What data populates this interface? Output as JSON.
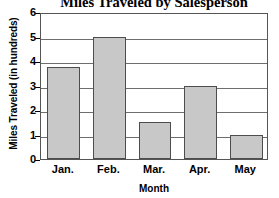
{
  "chart_data": {
    "type": "bar",
    "title": "Miles Traveled by Salesperson",
    "xlabel": "Month",
    "ylabel": "Miles Traveled (in hundreds)",
    "categories": [
      "Jan.",
      "Feb.",
      "Mar.",
      "Apr.",
      "May"
    ],
    "values": [
      3.75,
      5,
      1.5,
      3,
      1
    ],
    "ylim": [
      0,
      6
    ],
    "ytick_labels": [
      "0",
      "1",
      "2",
      "3",
      "4",
      "5",
      "6"
    ],
    "ytick_values": [
      0,
      1,
      2,
      3,
      4,
      5,
      6
    ],
    "grid": true,
    "legend": null,
    "bar_fill_color": "#c8c8c8",
    "bar_border_color": "#4d4d4d",
    "gridline_color": "#6e6e6e",
    "axis_color": "#555555",
    "background_color": "#ffffff",
    "text_color": "#000000"
  }
}
